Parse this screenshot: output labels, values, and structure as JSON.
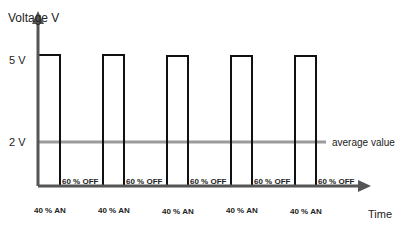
{
  "diagram": {
    "y_axis_label": "Voltage V",
    "x_axis_label": "Time",
    "y_ticks": [
      "5 V",
      "2 V"
    ],
    "average_label": "average value",
    "pulse_on_label": "40 % AN",
    "pulse_off_label": "60 % OFF",
    "pulses": [
      {
        "on": "40 % AN",
        "off": "60 % OFF"
      },
      {
        "on": "40 % AN",
        "off": "60 % OFF"
      },
      {
        "on": "40 % AN",
        "off": "60 % OFF"
      },
      {
        "on": "40 % AN",
        "off": "60 % OFF"
      },
      {
        "on": "40 % AN",
        "off": "60 % OFF"
      }
    ],
    "colors": {
      "axis": "#555555",
      "signal": "#111111",
      "average": "#999999"
    }
  }
}
